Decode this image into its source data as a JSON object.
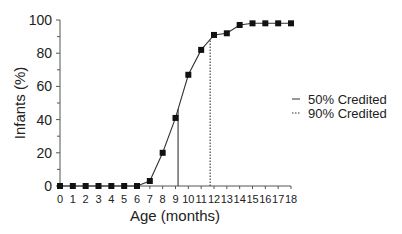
{
  "chart_data": {
    "type": "line",
    "title": "",
    "xlabel": "Age (months)",
    "ylabel": "Infants (%)",
    "x": [
      0,
      1,
      2,
      3,
      4,
      5,
      6,
      7,
      8,
      9,
      10,
      11,
      12,
      13,
      14,
      15,
      16,
      17,
      18
    ],
    "series": [
      {
        "name": "Infants (%)",
        "values": [
          0,
          0,
          0,
          0,
          0,
          0,
          0,
          3,
          20,
          41,
          67,
          82,
          91,
          92,
          97,
          98,
          98,
          98,
          98
        ]
      }
    ],
    "xticks": [
      "0",
      "1",
      "2",
      "3",
      "4",
      "5",
      "6",
      "7",
      "8",
      "9",
      "10",
      "11",
      "12",
      "13",
      "14",
      "15",
      "16",
      "17",
      "18"
    ],
    "yticks": [
      "0",
      "20",
      "40",
      "60",
      "80",
      "100"
    ],
    "xlim": [
      0,
      18
    ],
    "ylim": [
      0,
      100
    ],
    "reference_lines": [
      {
        "name": "50% Credited",
        "x": 9.2,
        "style": "solid"
      },
      {
        "name": "90% Credited",
        "x": 11.7,
        "style": "dotted"
      }
    ],
    "legend": [
      "50% Credited",
      "90% Credited"
    ],
    "legend_position": "right",
    "grid": false
  }
}
